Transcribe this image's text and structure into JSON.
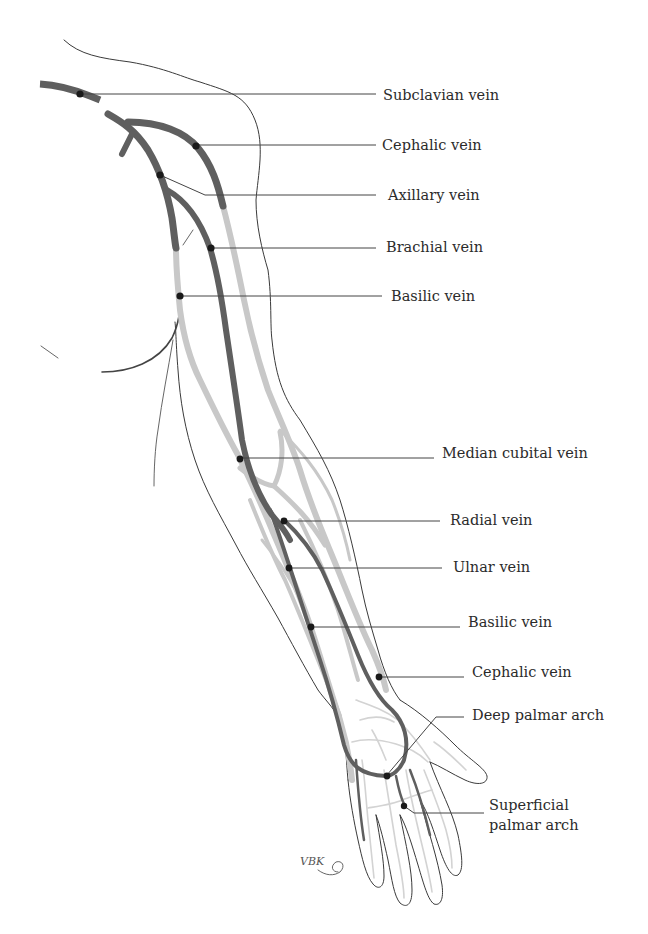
{
  "figure": {
    "colors": {
      "deep_veins": "#5f5f5f",
      "superficial_veins": "#c8c8c8",
      "outline": "#3a3a3a",
      "label_text": "#2b2b2b",
      "marker_dot": "#1a1a1a"
    },
    "labels": [
      {
        "id": "subclavian",
        "text": "Subclavian vein",
        "x": 383,
        "y": 88
      },
      {
        "id": "cephalic-upper",
        "text": "Cephalic vein",
        "x": 382,
        "y": 137
      },
      {
        "id": "axillary",
        "text": "Axillary vein",
        "x": 388,
        "y": 187
      },
      {
        "id": "brachial",
        "text": "Brachial vein",
        "x": 386,
        "y": 239
      },
      {
        "id": "basilic-upper",
        "text": "Basilic vein",
        "x": 391,
        "y": 288
      },
      {
        "id": "median-cubital",
        "text": "Median cubital vein",
        "x": 442,
        "y": 445
      },
      {
        "id": "radial",
        "text": "Radial vein",
        "x": 450,
        "y": 512
      },
      {
        "id": "ulnar",
        "text": "Ulnar vein",
        "x": 453,
        "y": 559
      },
      {
        "id": "basilic-lower",
        "text": "Basilic vein",
        "x": 468,
        "y": 614
      },
      {
        "id": "cephalic-lower",
        "text": "Cephalic vein",
        "x": 472,
        "y": 664
      },
      {
        "id": "deep-palmar-arch",
        "text": "Deep palmar arch",
        "x": 472,
        "y": 707
      },
      {
        "id": "superficial-palmar-arch-1",
        "text": "Superficial",
        "x": 489,
        "y": 797
      },
      {
        "id": "superficial-palmar-arch-2",
        "text": "palmar arch",
        "x": 489,
        "y": 817
      }
    ],
    "signature": "VBK"
  }
}
